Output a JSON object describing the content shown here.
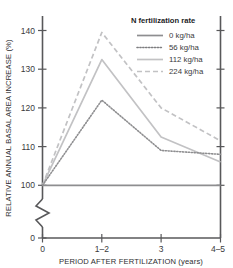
{
  "chart_data": {
    "type": "line",
    "title": "",
    "xlabel": "PERIOD AFTER FERTILIZATION (years)",
    "ylabel": "RELATIVE ANNUAL BASAL AREA INCREASE (%)",
    "legend_title": "N fertilization rate",
    "legend_position": "top-right",
    "grid": false,
    "x_categories": [
      "0",
      "1–2",
      "3",
      "4–5"
    ],
    "x_tick_labels": [
      "0",
      "1–2",
      "3",
      "4–5"
    ],
    "y_tick_labels": [
      "0",
      "100",
      "110",
      "120",
      "130",
      "140"
    ],
    "ylim": [
      100,
      143
    ],
    "y_axis_break": true,
    "y_break_note": "axis broken between 0 and 100",
    "series": [
      {
        "name": "0 kg/ha",
        "style": "solid",
        "color": "#8e8e90",
        "values": [
          100,
          100,
          100,
          100
        ]
      },
      {
        "name": "56 kg/ha",
        "style": "dotted",
        "color": "#8e8e90",
        "values": [
          100,
          122,
          109,
          108
        ]
      },
      {
        "name": "112 kg/ha",
        "style": "solid-light",
        "color": "#c2c2c4",
        "values": [
          100,
          132.5,
          112.5,
          106
        ]
      },
      {
        "name": "224 kg/ha",
        "style": "dashed",
        "color": "#c2c2c4",
        "values": [
          100,
          139.5,
          120,
          111.5
        ]
      }
    ]
  },
  "axis": {
    "x_title": "PERIOD AFTER FERTILIZATION (years)",
    "y_title": "RELATIVE ANNUAL BASAL AREA INCREASE (%)"
  },
  "legend": {
    "title": "N fertilization rate",
    "items": [
      {
        "label": "0 kg/ha"
      },
      {
        "label": "56 kg/ha"
      },
      {
        "label": "112 kg/ha"
      },
      {
        "label": "224 kg/ha"
      }
    ]
  },
  "ticks": {
    "y": [
      "140",
      "130",
      "120",
      "110",
      "100",
      "0"
    ],
    "x": [
      "0",
      "1–2",
      "3",
      "4–5"
    ]
  }
}
